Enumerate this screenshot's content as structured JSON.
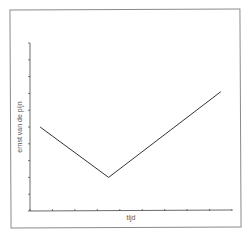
{
  "chart_data": {
    "type": "line",
    "title": "",
    "xlabel": "tijd",
    "ylabel": "ernst van de pijn",
    "x_tick_labels": [],
    "y_tick_labels": [],
    "x_ticks_count": 10,
    "y_ticks_count": 11,
    "xlim": [
      0,
      9
    ],
    "ylim": [
      0,
      10
    ],
    "grid": false,
    "legend": null,
    "series": [
      {
        "name": "pijn",
        "x": [
          0.45,
          3.5,
          8.5
        ],
        "y": [
          5.0,
          2.0,
          7.1
        ],
        "color": "#333333"
      }
    ]
  },
  "colors": {
    "frame": "#8a8a8a",
    "axis": "#444444",
    "line": "#333333",
    "label": "#555555"
  }
}
